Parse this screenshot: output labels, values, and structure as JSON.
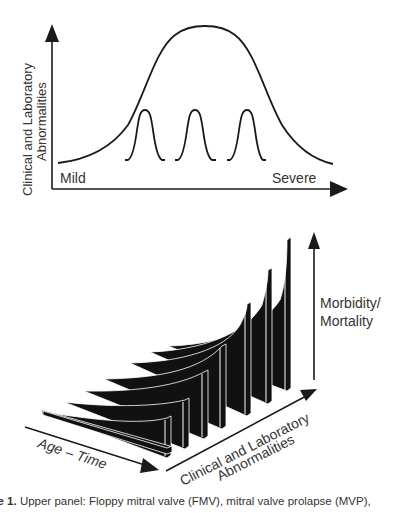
{
  "upper_panel": {
    "y_axis_label_line1": "Clinical and Laboratory",
    "y_axis_label_line2": "Abnormalities",
    "x_axis_left_label": "Mild",
    "x_axis_right_label": "Severe",
    "curves": {
      "broad_distribution": "bell curve spanning Mild to Severe",
      "narrow_peaks": 3
    }
  },
  "lower_panel": {
    "vertical_axis_label_line1": "Morbidity/",
    "vertical_axis_label_line2": "Mortality",
    "depth_axis_label": "Age – Time",
    "diagonal_axis_label_line1": "Clinical and Laboratory",
    "diagonal_axis_label_line2": "Abnormalities",
    "fin_count": 9
  },
  "caption": {
    "prefix": "ure 1.",
    "text": " Upper panel: Floppy mitral valve (FMV), mitral valve prolapse (MVP),"
  },
  "colors": {
    "ink": "#1a1a1a",
    "text": "#333333",
    "background": "#ffffff"
  }
}
